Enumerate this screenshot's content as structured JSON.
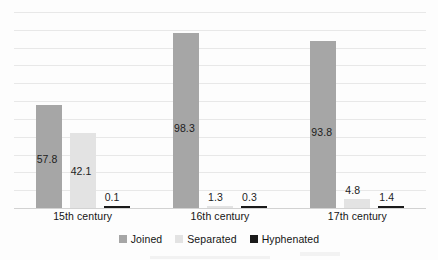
{
  "chart_data": {
    "type": "bar",
    "title": "",
    "xlabel": "",
    "ylabel": "",
    "categories": [
      "15th century",
      "16th century",
      "17th century"
    ],
    "series": [
      {
        "name": "Joined",
        "color": "#a6a6a6",
        "values": [
          57.8,
          98.3,
          93.8
        ]
      },
      {
        "name": "Separated",
        "color": "#e3e3e3",
        "values": [
          42.1,
          1.3,
          4.8
        ]
      },
      {
        "name": "Hyphenated",
        "color": "#1a1a1a",
        "values": [
          0.1,
          0.3,
          1.4
        ]
      }
    ],
    "value_labels": [
      [
        "57.8",
        "42.1",
        "0.1"
      ],
      [
        "98.3",
        "1.3",
        "0.3"
      ],
      [
        "93.8",
        "4.8",
        "1.4"
      ]
    ],
    "ylim": [
      0,
      110
    ],
    "ytick_step": 10,
    "ytick_labels_visible": false,
    "grid": true,
    "legend_position": "bottom"
  },
  "legend": {
    "items": [
      {
        "label": "Joined",
        "swatch": "joined-swatch"
      },
      {
        "label": "Separated",
        "swatch": "separated-swatch"
      },
      {
        "label": "Hyphenated",
        "swatch": "hyphenated-swatch"
      }
    ]
  },
  "axis": {
    "categories": [
      "15th century",
      "16th century",
      "17th century"
    ]
  }
}
